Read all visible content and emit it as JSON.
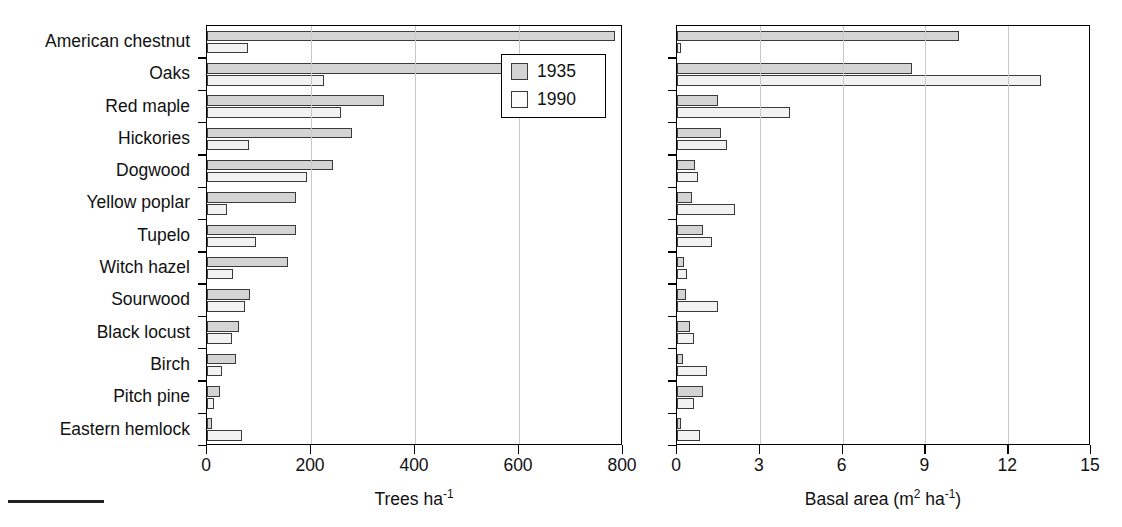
{
  "chart_data": {
    "type": "bar",
    "orientation": "horizontal",
    "title": "",
    "grid": true,
    "legend": {
      "position": "inside-top-right",
      "entries": [
        "1935",
        "1990"
      ]
    },
    "categories": [
      "American chestnut",
      "Oaks",
      "Red maple",
      "Hickories",
      "Dogwood",
      "Yellow poplar",
      "Tupelo",
      "Witch hazel",
      "Sourwood",
      "Black locust",
      "Birch",
      "Pitch pine",
      "Eastern hemlock"
    ],
    "panels": [
      {
        "id": "trees",
        "xlabel": "Trees ha",
        "xlabel_exponent": "-1",
        "xlim": [
          0,
          800
        ],
        "xticks": [
          0,
          200,
          400,
          600,
          800
        ],
        "series": [
          {
            "name": "1935",
            "values": [
              785,
              578,
              340,
              279,
              242,
              172,
              172,
              155,
              82,
              62,
              55,
              25,
              10
            ]
          },
          {
            "name": "1990",
            "values": [
              79,
              225,
              258,
              81,
              192,
              38,
              95,
              50,
              74,
              48,
              28,
              14,
              68
            ]
          }
        ]
      },
      {
        "id": "basal",
        "xlabel": "Basal area (m",
        "xlabel_exponent": "2",
        "xlabel_tail": " ha",
        "xlabel_exponent2": "-1",
        "xlabel_close": ")",
        "xlim": [
          0,
          15
        ],
        "xticks": [
          0,
          3,
          6,
          9,
          12,
          15
        ],
        "series": [
          {
            "name": "1935",
            "values": [
              10.2,
              8.5,
              1.5,
              1.6,
              0.65,
              0.56,
              0.93,
              0.25,
              0.33,
              0.47,
              0.2,
              0.95,
              0.15
            ]
          },
          {
            "name": "1990",
            "values": [
              0.15,
              13.2,
              4.1,
              1.8,
              0.77,
              2.1,
              1.25,
              0.38,
              1.5,
              0.62,
              1.1,
              0.6,
              0.85
            ]
          }
        ]
      }
    ],
    "colors": {
      "bar_1935": "#d4d4d4",
      "bar_1990": "#f2f2f2",
      "bar_stroke": "#3a3a3a",
      "grid": "#c9c9c9",
      "axis": "#000000"
    }
  }
}
